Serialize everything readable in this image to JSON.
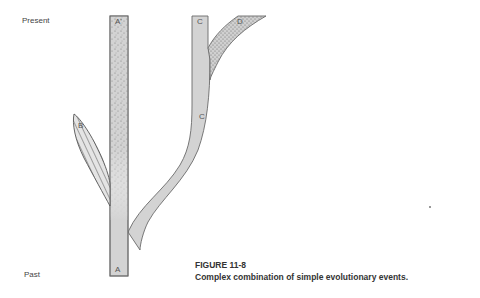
{
  "axis": {
    "top_label": "Present",
    "bottom_label": "Past"
  },
  "lineages": {
    "a_base": "A",
    "a_prime": "A'",
    "b": "B",
    "c_top": "C",
    "c_mid": "C",
    "d": "D"
  },
  "caption": {
    "figure_number": "FIGURE 11-8",
    "title": "Complex combination of simple evolutionary events."
  },
  "colors": {
    "branch_fill": "#d3d3d3",
    "branch_stroke": "#6a6a6a",
    "stipple": "#7a7a7a",
    "hatch": "#555555"
  }
}
